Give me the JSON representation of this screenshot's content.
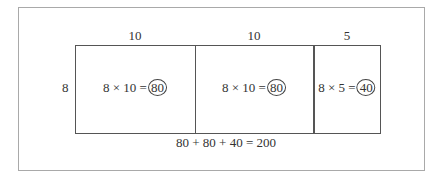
{
  "diagram": {
    "top_labels": [
      "10",
      "10",
      "5"
    ],
    "side_label": "8",
    "cells": [
      {
        "expression": "8 × 10 =",
        "result": "80"
      },
      {
        "expression": "8 × 10 =",
        "result": "80"
      },
      {
        "expression": "8 × 5 =",
        "result": "40"
      }
    ],
    "sum_equation": "80 + 80 + 40 = 200"
  }
}
